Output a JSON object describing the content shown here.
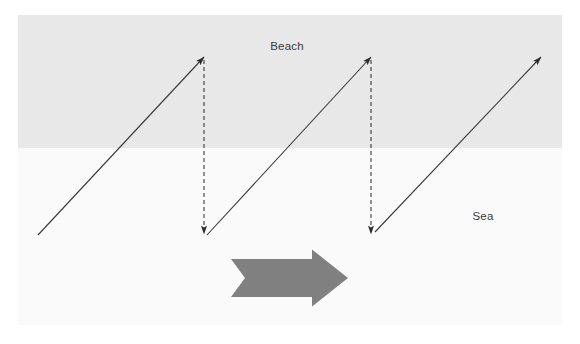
{
  "canvas": {
    "width": 580,
    "height": 344,
    "background_color": "#ffffff"
  },
  "diagram": {
    "zones": [
      {
        "name": "beach",
        "label": "Beach",
        "color": "#e8e8e8",
        "x": 18,
        "y": 15,
        "width": 544,
        "height": 133,
        "label_x": 287,
        "label_y": 47
      },
      {
        "name": "sea",
        "label": "Sea",
        "color": "#fafafa",
        "x": 18,
        "y": 148,
        "width": 544,
        "height": 177,
        "label_x": 483,
        "label_y": 217
      }
    ],
    "swash_arrows": [
      {
        "name": "swash-arrow-1",
        "x1": 38,
        "y1": 235,
        "x2": 204,
        "y2": 57
      },
      {
        "name": "swash-arrow-2",
        "x1": 207,
        "y1": 235,
        "x2": 371,
        "y2": 57
      },
      {
        "name": "swash-arrow-3",
        "x1": 375,
        "y1": 232,
        "x2": 541,
        "y2": 57
      }
    ],
    "backwash_arrows": [
      {
        "name": "backwash-arrow-1",
        "x1": 204,
        "y1": 60,
        "x2": 204,
        "y2": 234
      },
      {
        "name": "backwash-arrow-2",
        "x1": 371,
        "y1": 60,
        "x2": 371,
        "y2": 234
      }
    ],
    "arrow_style": {
      "stroke_color": "#3a3a3a",
      "stroke_width": 1.1,
      "dash_pattern": "4,3"
    },
    "drift_arrow": {
      "name": "longshore-drift-direction-arrow",
      "color": "#808080",
      "x": 231,
      "y": 259,
      "width": 117,
      "height": 38,
      "direction": "right"
    }
  }
}
